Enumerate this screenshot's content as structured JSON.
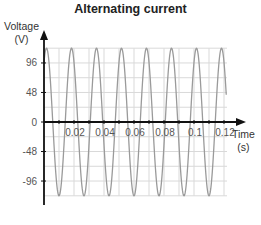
{
  "chart_data": {
    "type": "line",
    "title": "Alternating current",
    "xlabel": "Time",
    "xunit": "(s)",
    "ylabel": "Voltage",
    "yunit": "(V)",
    "xlim": [
      0,
      0.125
    ],
    "ylim": [
      -130,
      130
    ],
    "x_ticks": [
      0.02,
      0.04,
      0.06,
      0.08,
      0.1,
      0.12
    ],
    "x_tick_labels": [
      "0.02",
      "0.04",
      "0.06",
      "0.08",
      "0.1",
      "0.12"
    ],
    "y_ticks": [
      96,
      48,
      0,
      -48,
      -96
    ],
    "y_tick_labels": [
      "96",
      "48",
      "0",
      "-48",
      "-96"
    ],
    "grid": true,
    "series": [
      {
        "name": "Voltage",
        "function": "sine",
        "amplitude": 120,
        "frequency_hz": 60,
        "period_s": 0.0167,
        "color": "#9a9a9a",
        "x": [
          0,
          0.0042,
          0.0083,
          0.0125,
          0.0167,
          0.0208,
          0.025,
          0.0292,
          0.0333,
          0.0375,
          0.0417,
          0.0458,
          0.05,
          0.0542,
          0.0583,
          0.0625,
          0.0667,
          0.0708,
          0.075,
          0.0792,
          0.0833,
          0.0875,
          0.0917,
          0.0958,
          0.1,
          0.1042,
          0.1083,
          0.1125,
          0.1167,
          0.1208
        ],
        "values": [
          0,
          120,
          0,
          -120,
          0,
          120,
          0,
          -120,
          0,
          120,
          0,
          -120,
          0,
          120,
          0,
          -120,
          0,
          120,
          0,
          -120,
          0,
          120,
          0,
          -120,
          0,
          120,
          0,
          -120,
          0,
          120
        ]
      }
    ]
  },
  "colors": {
    "axis": "#111111",
    "grid": "#d9d9d9",
    "wave": "#9a9a9a"
  }
}
